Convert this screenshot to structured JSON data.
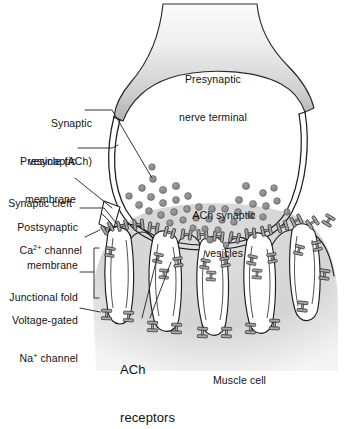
{
  "figure": {
    "type": "anatomical-diagram"
  },
  "labels": {
    "synaptic_vesicle_l1": "Synaptic",
    "synaptic_vesicle_l2": "vesicle (ACh)",
    "presynaptic_membrane_l1": "Presynaptic",
    "presynaptic_membrane_l2": "membrane",
    "synaptic_cleft": "Synaptic cleft",
    "postsynaptic_membrane_l1": "Postsynaptic",
    "postsynaptic_membrane_l2": "membrane",
    "ca_channel_pre": "Ca",
    "ca_channel_sup": "2+",
    "ca_channel_post": " channel",
    "junctional_fold": "Junctional fold",
    "voltage_gated": "Voltage-gated",
    "na_pre": "Na",
    "na_sup": "+",
    "na_post": " channel",
    "presynaptic_terminal_l1": "Presynaptic",
    "presynaptic_terminal_l2": "nerve terminal",
    "ach_vesicles_l1": "ACh synaptic",
    "ach_vesicles_l2": "vesicles",
    "ach_receptors_l1": "ACh",
    "ach_receptors_l2": "receptors",
    "muscle_cell": "Muscle cell"
  },
  "colors": {
    "background": "#ffffff",
    "outline": "#1a1a1a",
    "terminal_fill_top": "#f3f3f3",
    "terminal_fill_bottom": "#b9b9b9",
    "muscle_fill": "#d2d2d2",
    "muscle_fill_edge": "#ededed",
    "vesicle_fill": "#8d8d8d",
    "vesicle_stroke": "#5c5c5c",
    "receptor_fill": "#a8a8a8",
    "receptor_stroke": "#3a3a3a",
    "leader_line": "#2b2b2b"
  },
  "chart_data": {
    "type": "diagram",
    "vesicles": [
      {
        "x": 153,
        "y": 179,
        "r": 3.4
      },
      {
        "x": 142,
        "y": 188,
        "r": 3.4
      },
      {
        "x": 163,
        "y": 190,
        "r": 3.6
      },
      {
        "x": 176,
        "y": 186,
        "r": 3.6
      },
      {
        "x": 151,
        "y": 197,
        "r": 3.5
      },
      {
        "x": 139,
        "y": 205,
        "r": 3.5
      },
      {
        "x": 163,
        "y": 203,
        "r": 3.5
      },
      {
        "x": 176,
        "y": 200,
        "r": 3.4
      },
      {
        "x": 188,
        "y": 196,
        "r": 3.4
      },
      {
        "x": 246,
        "y": 186,
        "r": 3.6
      },
      {
        "x": 263,
        "y": 193,
        "r": 3.4
      },
      {
        "x": 274,
        "y": 188,
        "r": 3.3
      },
      {
        "x": 239,
        "y": 200,
        "r": 3.5
      },
      {
        "x": 253,
        "y": 204,
        "r": 3.5
      },
      {
        "x": 266,
        "y": 206,
        "r": 3.4
      },
      {
        "x": 277,
        "y": 201,
        "r": 3.3
      },
      {
        "x": 149,
        "y": 211,
        "r": 3.4
      },
      {
        "x": 161,
        "y": 215,
        "r": 3.4
      },
      {
        "x": 174,
        "y": 212,
        "r": 3.4
      },
      {
        "x": 187,
        "y": 209,
        "r": 3.4
      },
      {
        "x": 199,
        "y": 207,
        "r": 3.4
      },
      {
        "x": 212,
        "y": 209,
        "r": 3.4
      },
      {
        "x": 225,
        "y": 209,
        "r": 3.4
      },
      {
        "x": 238,
        "y": 212,
        "r": 3.4
      },
      {
        "x": 251,
        "y": 215,
        "r": 3.4
      },
      {
        "x": 263,
        "y": 217,
        "r": 3.3
      },
      {
        "x": 170,
        "y": 223,
        "r": 3.3
      },
      {
        "x": 183,
        "y": 220,
        "r": 3.3
      },
      {
        "x": 196,
        "y": 218,
        "r": 3.3
      },
      {
        "x": 209,
        "y": 219,
        "r": 3.3
      },
      {
        "x": 222,
        "y": 220,
        "r": 3.3
      },
      {
        "x": 234,
        "y": 222,
        "r": 3.3
      },
      {
        "x": 205,
        "y": 229,
        "r": 3.2
      },
      {
        "x": 218,
        "y": 230,
        "r": 3.2
      },
      {
        "x": 193,
        "y": 228,
        "r": 3.2
      },
      {
        "x": 210,
        "y": 240,
        "r": 3.2
      },
      {
        "x": 226,
        "y": 245,
        "r": 3.0
      },
      {
        "x": 152,
        "y": 167,
        "r": 3.2
      },
      {
        "x": 129,
        "y": 196,
        "r": 3.3
      },
      {
        "x": 287,
        "y": 212,
        "r": 3.2
      }
    ],
    "folds": 6,
    "receptor_count_approx": 40
  }
}
